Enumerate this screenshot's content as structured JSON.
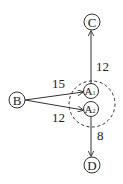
{
  "diagram": {
    "nodes": {
      "B": {
        "label": "B"
      },
      "C": {
        "label": "C"
      },
      "D": {
        "label": "D"
      },
      "A1": {
        "label": "A",
        "subscript": "1"
      },
      "A2": {
        "label": "A",
        "subscript": "2"
      }
    },
    "edges": {
      "B_A1": {
        "from": "B",
        "to": "A1",
        "weight": "15"
      },
      "B_A2": {
        "from": "B",
        "to": "A2",
        "weight": "12"
      },
      "A1_C": {
        "from": "A1",
        "to": "C",
        "weight": "12"
      },
      "A2_D": {
        "from": "A2",
        "to": "D",
        "weight": "8"
      }
    },
    "group": {
      "members": [
        "A1",
        "A2"
      ],
      "style": "dashed-circle"
    },
    "colors": {
      "stroke": "#333333",
      "text": "#222222",
      "background": "#ffffff"
    }
  }
}
